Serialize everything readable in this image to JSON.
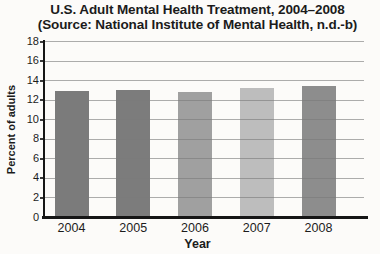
{
  "title": {
    "line1": "U.S. Adult Mental Health Treatment, 2004–2008",
    "line2": "(Source: National Institute of Mental Health, n.d.-b)"
  },
  "chart_data": {
    "type": "bar",
    "title": "U.S. Adult Mental Health Treatment, 2004–2008",
    "subtitle": "(Source: National Institute of Mental Health, n.d.-b)",
    "categories": [
      "2004",
      "2005",
      "2006",
      "2007",
      "2008"
    ],
    "values": [
      12.9,
      13.0,
      12.8,
      13.2,
      13.4
    ],
    "bar_colors": [
      "#7b7b7b",
      "#7c7c7c",
      "#a0a0a0",
      "#bdbdbd",
      "#8d8d8d"
    ],
    "xlabel": "Year",
    "ylabel": "Percent of adults",
    "ylim": [
      0,
      18
    ],
    "yticks": [
      0,
      2,
      4,
      6,
      8,
      10,
      12,
      14,
      16,
      18
    ],
    "grid": true,
    "legend": "none",
    "gridline_color": "#7a7a7a",
    "axis_color": "#161616",
    "text_color": "#1b1b1b"
  }
}
